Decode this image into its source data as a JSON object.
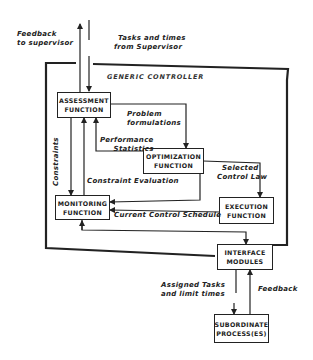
{
  "diagram": {
    "container_title": "GENERIC CONTROLLER",
    "nodes": {
      "assessment": {
        "line1": "ASSESSMENT",
        "line2": "FUNCTION"
      },
      "optimization": {
        "line1": "OPTIMIZATION",
        "line2": "FUNCTION"
      },
      "monitoring": {
        "line1": "MONITORING",
        "line2": "FUNCTION"
      },
      "execution": {
        "line1": "EXECUTION",
        "line2": "FUNCTION"
      },
      "interface": {
        "line1": "INTERFACE",
        "line2": "MODULES"
      },
      "subordinate": {
        "line1": "SUBORDINATE",
        "line2": "PROCESS(ES)"
      }
    },
    "edges": {
      "feedback_to_supervisor": {
        "line1": "Feedback",
        "line2": "to supervisor"
      },
      "tasks_from_supervisor": {
        "line1": "Tasks and times",
        "line2": "from Supervisor"
      },
      "problem_formulations": {
        "line1": "Problem",
        "line2": "formulations"
      },
      "performance_statistics": {
        "line1": "Performance",
        "line2": "Statistics"
      },
      "constraints": "Constraints",
      "constraint_evaluation": "Constraint Evaluation",
      "selected_control_law": {
        "line1": "Selected",
        "line2": "Control Law"
      },
      "current_control_schedule": "Current Control Schedule",
      "assigned_tasks": {
        "line1": "Assigned Tasks",
        "line2": "and limit times"
      },
      "feedback": "Feedback"
    }
  }
}
